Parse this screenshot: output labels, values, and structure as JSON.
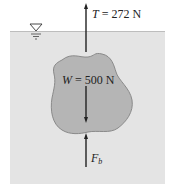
{
  "figure": {
    "tension": {
      "symbol": "T",
      "eq": " = 272 N",
      "direction": "up"
    },
    "weight": {
      "symbol": "W",
      "eq": " = 500 N",
      "direction": "down"
    },
    "buoyancy": {
      "symbol": "F",
      "subscript": "b",
      "direction": "up"
    },
    "free_surface_symbol": "water-level-triangle",
    "colors": {
      "water": "#e4e4e4",
      "body": "#b5b5b5",
      "body_outline": "#8a8a8a",
      "arrow": "#222222"
    }
  }
}
